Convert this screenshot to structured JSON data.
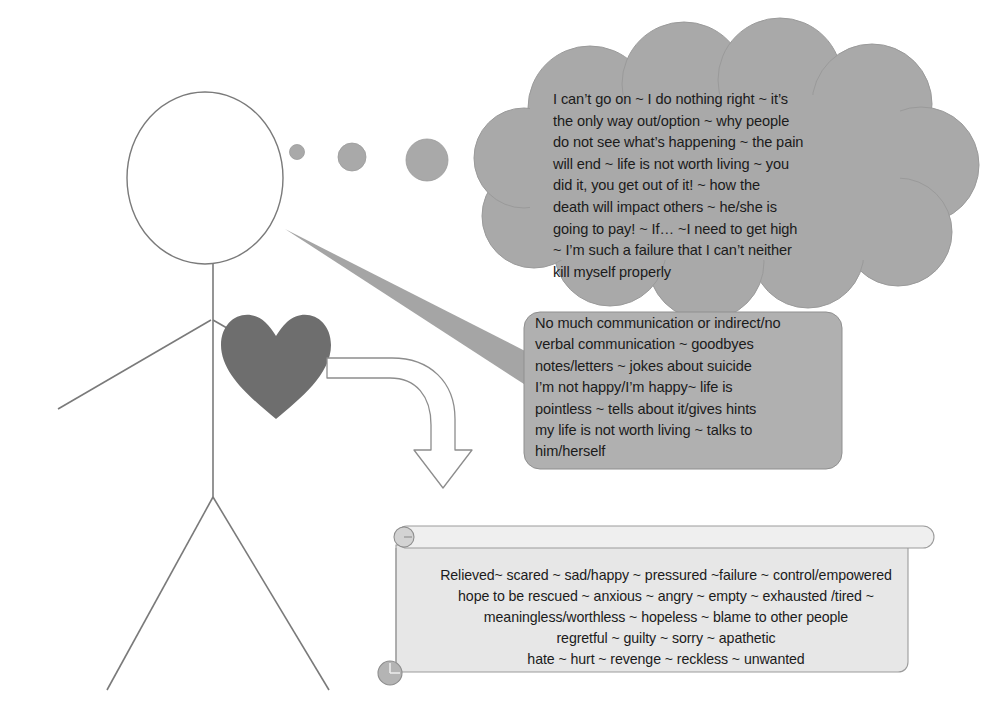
{
  "figure": {
    "alt": "stick figure person",
    "parts": [
      "head",
      "body",
      "left-arm",
      "right-arm",
      "left-leg",
      "right-leg"
    ],
    "heart_label": "heart",
    "arrow_label": "curved down arrow"
  },
  "colors": {
    "cloud_fill": "#a9a9a9",
    "cloud_stroke": "#9a9a9a",
    "speech_fill": "#b0b0b0",
    "speech_stroke": "#8f8f8f",
    "scroll_fill": "#e7e7e7",
    "scroll_stroke": "#9c9c9c",
    "scroll_bar_fill": "#efefef",
    "heart_fill": "#6e6e6e",
    "figure_stroke": "#7a7a7a",
    "text": "#1b1b1b",
    "tail_fill": "#a5a5a5",
    "curl_fill": "#b4b4b4",
    "background": "#ffffff"
  },
  "thought_cloud": {
    "name": "thoughts",
    "dots": 3,
    "text": "I can’t go on ~ I do nothing right ~ it’s\nthe only way out/option ~ why people\ndo not see what’s happening ~ the pain\nwill end ~ life is not worth living ~ you\ndid it, you get out of it! ~ how the\ndeath will impact others ~ he/she is\ngoing to pay! ~ If… ~I need to get high\n~ I’m such a failure that I can’t neither\nkill myself properly",
    "lines": [
      "I can’t go on ~ I do nothing right ~ it’s",
      "the only way out/option ~ why people",
      "do not see what’s happening ~ the pain",
      "will end ~ life is not worth living ~ you",
      "did it, you get out of it! ~ how the",
      "death will impact others ~ he/she is",
      "going to pay! ~ If… ~I need to get high",
      "~ I’m such a failure that I can’t neither",
      "kill myself properly"
    ]
  },
  "speech_bubble": {
    "name": "what the person says",
    "text": "No much communication or indirect/no\nverbal communication ~ goodbyes\nnotes/letters ~ jokes about suicide\nI’m not happy/I’m happy~ life is\npointless ~ tells about it/gives hints\nmy life is not worth living ~ talks to\nhim/herself",
    "lines": [
      "No much communication or indirect/no",
      "verbal communication ~ goodbyes",
      "notes/letters ~ jokes about suicide",
      "I’m not happy/I’m happy~ life is",
      "pointless ~ tells about it/gives hints",
      "my life is not worth living ~ talks to",
      "him/herself"
    ]
  },
  "scroll_banner": {
    "name": "feelings list",
    "text": "Relieved~ scared ~ sad/happy ~ pressured ~failure ~ control/empowered\nhope to be rescued ~ anxious ~ angry ~ empty ~ exhausted /tired ~\nmeaningless/worthless ~ hopeless ~ blame to other people\nregretful ~ guilty ~ sorry ~ apathetic\nhate ~ hurt ~ revenge ~ reckless ~ unwanted",
    "lines": [
      "Relieved~ scared ~ sad/happy ~ pressured ~failure ~ control/empowered",
      "hope to be rescued ~ anxious ~ angry ~ empty ~ exhausted /tired ~",
      "meaningless/worthless ~ hopeless ~ blame to other people",
      "regretful ~ guilty ~ sorry ~ apathetic",
      "hate ~ hurt ~ revenge ~ reckless ~ unwanted"
    ]
  }
}
